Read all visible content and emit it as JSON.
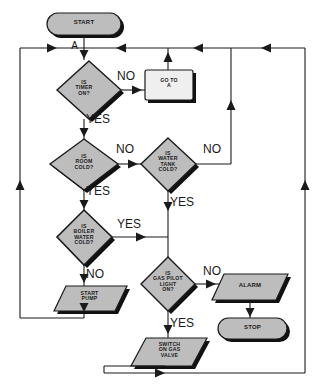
{
  "diagram": {
    "palette": {
      "node_fill": "#bdbdbd",
      "node_fill_light": "#efefef",
      "stroke": "#1a1a1a",
      "shadow": "#111111",
      "background": "#ffffff",
      "text": "#1b1b1b"
    },
    "nodes": [
      {
        "id": "start",
        "type": "terminator",
        "label": "START"
      },
      {
        "id": "timer",
        "type": "decision",
        "label": "IS\nTIMER\nON?"
      },
      {
        "id": "goto_a",
        "type": "process",
        "label": "GO TO\nA"
      },
      {
        "id": "room",
        "type": "decision",
        "label": "IS\nROOM\nCOLD?"
      },
      {
        "id": "water_tank",
        "type": "decision",
        "label": "IS\nWATER\nTANK\nCOLD?"
      },
      {
        "id": "boiler",
        "type": "decision",
        "label": "IS\nBOILER\nWATER\nCOLD?"
      },
      {
        "id": "start_pump",
        "type": "input_output",
        "label": "START\nPUMP"
      },
      {
        "id": "gas_pilot",
        "type": "decision",
        "label": "IS\nGAS PILOT\nLIGHT\nON?"
      },
      {
        "id": "alarm",
        "type": "input_output",
        "label": "ALARM"
      },
      {
        "id": "stop",
        "type": "terminator",
        "label": "STOP"
      },
      {
        "id": "gas_valve",
        "type": "input_output",
        "label": "SWITCH\nON GAS\nVALVE"
      }
    ],
    "connector_labels": [
      {
        "id": "conn_a",
        "label": "A"
      }
    ],
    "branch_labels": [
      {
        "id": "timer_no",
        "label": "NO"
      },
      {
        "id": "timer_yes",
        "label": "YES"
      },
      {
        "id": "room_no",
        "label": "NO"
      },
      {
        "id": "room_yes",
        "label": "YES"
      },
      {
        "id": "tank_no",
        "label": "NO"
      },
      {
        "id": "tank_yes",
        "label": "YES"
      },
      {
        "id": "boiler_yes",
        "label": "YES"
      },
      {
        "id": "boiler_no",
        "label": "NO"
      },
      {
        "id": "pilot_no",
        "label": "NO"
      },
      {
        "id": "pilot_yes",
        "label": "YES"
      }
    ]
  }
}
